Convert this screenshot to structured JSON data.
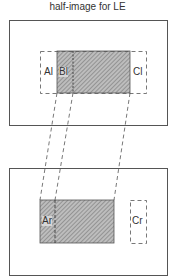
{
  "title": "half-image  for LE",
  "colors": {
    "stroke": "#555555",
    "hatch": "#777777",
    "background": "#ffffff"
  },
  "top_panel": {
    "frame": {
      "x": 9,
      "y": 20,
      "w": 158,
      "h": 105
    },
    "dashed_region": {
      "x": 40,
      "y": 51,
      "w": 106,
      "h": 42
    },
    "hatched_region": {
      "x": 57,
      "y": 51,
      "w": 73,
      "h": 42
    },
    "divider_x": 73,
    "labels": {
      "a": "Al",
      "b": "Bl",
      "c": "Cl"
    }
  },
  "bottom_panel": {
    "frame": {
      "x": 9,
      "y": 168,
      "w": 158,
      "h": 107
    },
    "hatched_region": {
      "x": 40,
      "y": 200,
      "w": 74,
      "h": 43
    },
    "divider_x": 55,
    "c_box": {
      "x": 130,
      "y": 200,
      "w": 16,
      "h": 43
    },
    "labels": {
      "a": "Ar",
      "c": "Cr"
    }
  },
  "connectors": [
    {
      "from": [
        57,
        93
      ],
      "to": [
        40,
        200
      ]
    },
    {
      "from": [
        73,
        93
      ],
      "to": [
        55,
        200
      ]
    },
    {
      "from": [
        130,
        93
      ],
      "to": [
        114,
        200
      ]
    }
  ]
}
